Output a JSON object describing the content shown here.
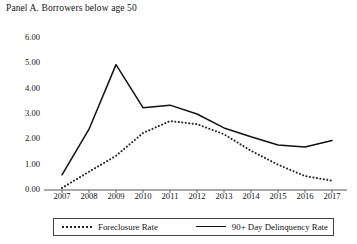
{
  "panel": {
    "title": "Panel A. Borrowers below age 50"
  },
  "legend": {
    "foreclosure_label": "Foreclosure Rate",
    "delinquency_label": "90+ Day Delinquency Rate"
  },
  "axis": {
    "y_ticks": [
      "0.00",
      "1.00",
      "2.00",
      "3.00",
      "4.00",
      "5.00",
      "6.00"
    ],
    "x_ticks": [
      "2007",
      "2008",
      "2009",
      "2010",
      "2011",
      "2012",
      "2013",
      "2014",
      "2015",
      "2016",
      "2017"
    ]
  },
  "colors": {
    "line": "#111111",
    "dots": "#222222",
    "axis": "#444444",
    "text": "#141414"
  },
  "chart_data": {
    "type": "line",
    "title": "Panel A. Borrowers below age 50",
    "xlabel": "",
    "ylabel": "",
    "x": [
      2007,
      2008,
      2009,
      2010,
      2011,
      2012,
      2013,
      2014,
      2015,
      2016,
      2017
    ],
    "categories": [
      "2007",
      "2008",
      "2009",
      "2010",
      "2011",
      "2012",
      "2013",
      "2014",
      "2015",
      "2016",
      "2017"
    ],
    "ylim": [
      0,
      6
    ],
    "ytick_values": [
      0,
      1,
      2,
      3,
      4,
      5,
      6
    ],
    "grid": false,
    "legend_position": "bottom",
    "series": [
      {
        "name": "Foreclosure Rate",
        "style": "dotted",
        "values": [
          0.08,
          0.72,
          1.35,
          2.25,
          2.72,
          2.6,
          2.2,
          1.55,
          1.0,
          0.55,
          0.37
        ]
      },
      {
        "name": "90+ Day Delinquency Rate",
        "style": "solid",
        "values": [
          0.6,
          2.4,
          4.95,
          3.25,
          3.35,
          3.0,
          2.45,
          2.1,
          1.78,
          1.7,
          1.95
        ]
      }
    ]
  }
}
